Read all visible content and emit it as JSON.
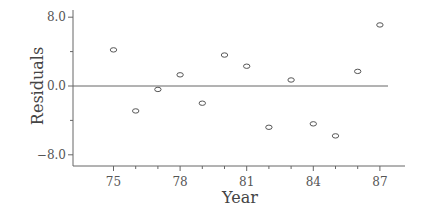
{
  "chart_data": {
    "type": "scatter",
    "title": "",
    "xlabel": "Year",
    "ylabel": "Residuals",
    "x": [
      75,
      76,
      77,
      78,
      79,
      80,
      81,
      82,
      83,
      84,
      85,
      86,
      87
    ],
    "y": [
      4.2,
      -2.9,
      -0.4,
      1.3,
      -2.0,
      3.6,
      2.3,
      -4.8,
      0.7,
      -4.4,
      -5.8,
      1.7,
      7.1
    ],
    "xticks": [
      75,
      78,
      81,
      84,
      87
    ],
    "xtick_labels": [
      "75",
      "78",
      "81",
      "84",
      "87"
    ],
    "xminor_ticks": [
      76,
      77,
      79,
      80,
      82,
      83,
      85,
      86
    ],
    "yticks": [
      8.0,
      0.0,
      -8.0
    ],
    "ytick_labels": [
      "8.0",
      "0.0",
      "−8.0"
    ],
    "yminor_ticks": [
      4.0,
      -4.0
    ],
    "xlim": [
      72.3,
      88.1
    ],
    "ylim": [
      -9.4,
      9.0
    ],
    "reference_line": {
      "y": 0.0,
      "label": "zero line"
    },
    "marker": "open-circle",
    "grid": false,
    "legend": null
  },
  "labels": {
    "x_axis_title": "Year",
    "y_axis_title": "Residuals"
  },
  "colors": {
    "axis": "#666666",
    "marker": "#555555",
    "text": "#555555"
  }
}
